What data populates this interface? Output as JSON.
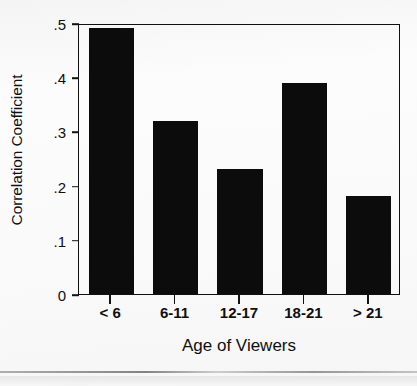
{
  "chart_data": {
    "type": "bar",
    "title": "",
    "categories": [
      "< 6",
      "6-11",
      "12-17",
      "18-21",
      "> 21"
    ],
    "values": [
      0.49,
      0.32,
      0.23,
      0.39,
      0.18
    ],
    "xlabel": "Age of Viewers",
    "ylabel": "Correlation Coefficient",
    "ylim": [
      0,
      0.5
    ],
    "ytick_values": [
      0.5,
      0.4,
      0.3,
      0.2,
      0.1,
      0
    ],
    "ytick_labels": [
      ".5",
      ".4",
      ".3",
      ".2",
      ".1",
      "0"
    ],
    "grid": false,
    "legend": null,
    "bar_color": "#0c0c0c",
    "axis_color": "#101010",
    "background_color": "#fbfbfb"
  }
}
